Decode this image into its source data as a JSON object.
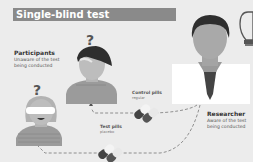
{
  "title": "Single-blind test",
  "participants": {
    "heading": "Participants",
    "line1": "Unaware of the test",
    "line2": "being conducted",
    "question_mark": "?"
  },
  "researcher": {
    "heading": "Researcher",
    "line1": "Aware of the test",
    "line2": "being conducted"
  },
  "pills": {
    "control": {
      "label": "Control pills",
      "sub": "regular"
    },
    "test": {
      "label": "Test pills",
      "sub": "placebo"
    }
  },
  "icons": [
    "lightbulb-icon",
    "pill-capsule-icon",
    "question-mark-icon",
    "blindfold-icon"
  ],
  "colors": {
    "background": "#ececec",
    "title_bar": "#8a8a8a",
    "figure_gray": "#a9a9a9",
    "hair_dark": "#2e2e2e",
    "coat_white": "#ffffff"
  }
}
